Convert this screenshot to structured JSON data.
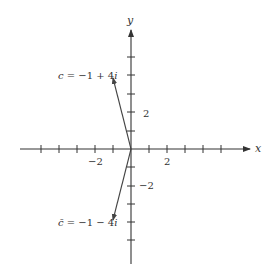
{
  "diagram": {
    "type": "complex-plane",
    "axes": {
      "x_label": "x",
      "y_label": "y",
      "x_tick_labels": [
        {
          "value": -2,
          "text": "−2"
        },
        {
          "value": 2,
          "text": "2"
        }
      ],
      "y_tick_labels": [
        {
          "value": 2,
          "text": "2"
        },
        {
          "value": -2,
          "text": "−2"
        }
      ],
      "x_range": [
        -6,
        6
      ],
      "y_range": [
        -6,
        6
      ]
    },
    "vectors": [
      {
        "name": "c",
        "label": "c = −1 + 4i",
        "x": -1,
        "y": 4
      },
      {
        "name": "c-conjugate",
        "label": "c̄ = −1 − 4i",
        "x": -1,
        "y": -4
      }
    ]
  },
  "labels": {
    "x": "x",
    "y": "y",
    "xm2": "−2",
    "x2": "2",
    "y2": "2",
    "ym2": "−2",
    "c_lhs": "c",
    "c_rhs": " = −1 + 4",
    "c_i": "i",
    "cbar_lhs": "c̄",
    "cbar_rhs": " = −1 − 4",
    "cbar_i": "i"
  }
}
